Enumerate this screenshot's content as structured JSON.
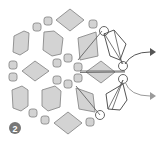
{
  "diagram": {
    "step_badge": {
      "label": "2",
      "color": "#777777"
    },
    "colors": {
      "piece_fill": "#d3d3d3",
      "piece_stroke": "#8a8a8a",
      "outline_stroke": "#555555",
      "arrow_dark": "#555555",
      "arrow_light": "#9a9a9a"
    },
    "pieces": {
      "large_diamonds": 4,
      "large_hexagons": 4,
      "small_octagons": 14,
      "highlighted_pieces": 3,
      "outline_diamonds": 2,
      "circled_joints": 4
    },
    "arrows": [
      {
        "name": "upper-arrow",
        "shade": "dark"
      },
      {
        "name": "lower-arrow",
        "shade": "light"
      }
    ]
  }
}
